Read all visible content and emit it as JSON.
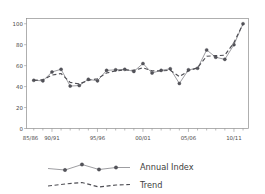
{
  "chart_data": {
    "type": "line",
    "title": "",
    "subtitle": "",
    "xlabel": "",
    "ylabel": "",
    "xlim": [
      1987.2,
      2011.6
    ],
    "ylim": [
      0,
      105
    ],
    "grid": false,
    "legend_position": "bottom-center",
    "y_ticks": [
      0,
      20,
      40,
      60,
      80,
      100
    ],
    "y_tick_labels": [
      "0",
      "20",
      "40",
      "60",
      "80",
      "100"
    ],
    "x_tick_labels": [
      "85/86",
      "90/91",
      "95/96",
      "00/01",
      "05/06",
      "10/11"
    ],
    "x_tick_values": [
      1985,
      1990,
      1995,
      2000,
      2005,
      2010
    ],
    "x_minor_tick_step": 1,
    "x": [
      1988,
      1989,
      1990,
      1991,
      1992,
      1993,
      1994,
      1995,
      1996,
      1997,
      1998,
      1999,
      2000,
      2001,
      2002,
      2003,
      2004,
      2005,
      2006,
      2007,
      2008,
      2009,
      2010,
      2011
    ],
    "series": [
      {
        "name": "Annual Index",
        "style": "solid-with-markers",
        "color": "#7c7c82",
        "marker": "circle",
        "values": [
          46,
          45.5,
          54,
          56.5,
          40.5,
          41,
          47,
          45.5,
          55.5,
          56,
          56.5,
          54.5,
          62,
          53,
          55.5,
          57,
          43,
          56,
          57.5,
          75,
          68,
          66,
          80,
          100
        ]
      },
      {
        "name": "Trend",
        "style": "dashed",
        "color": "#4e4e54",
        "marker": "none",
        "values": [
          46,
          46.5,
          51,
          52.5,
          44,
          42.5,
          46,
          47.5,
          53,
          55,
          56,
          55.5,
          58,
          55,
          55,
          55.5,
          49.5,
          55,
          58,
          69,
          69.5,
          70,
          82,
          100
        ]
      }
    ]
  },
  "legend": {
    "items": [
      {
        "label": "Annual Index",
        "color": "#7c7c82",
        "style": "solid-with-markers"
      },
      {
        "label": "Trend",
        "color": "#4e4e54",
        "style": "dashed"
      }
    ]
  }
}
